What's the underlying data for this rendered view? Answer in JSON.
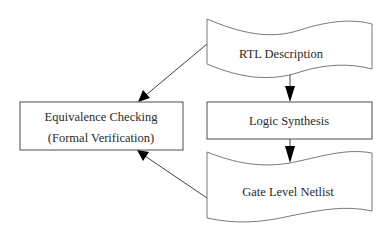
{
  "diagram": {
    "type": "flowchart",
    "nodes": {
      "rtl": {
        "label": "RTL Description",
        "shape": "document"
      },
      "synthesis": {
        "label": "Logic Synthesis",
        "shape": "rectangle"
      },
      "netlist": {
        "label": "Gate Level Netlist",
        "shape": "document"
      },
      "equivalence": {
        "label_line1": "Equivalence Checking",
        "label_line2": "(Formal Verification)",
        "shape": "rectangle"
      }
    },
    "edges": [
      {
        "from": "rtl",
        "to": "synthesis"
      },
      {
        "from": "synthesis",
        "to": "netlist"
      },
      {
        "from": "rtl",
        "to": "equivalence"
      },
      {
        "from": "netlist",
        "to": "equivalence"
      }
    ],
    "colors": {
      "stroke": "#3a3a3a",
      "arrowhead": "#000000",
      "background": "#ffffff",
      "text": "#2a2a2a"
    }
  }
}
